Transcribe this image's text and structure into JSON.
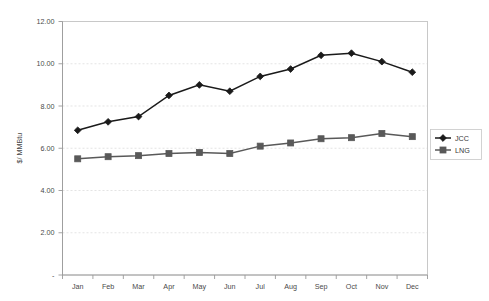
{
  "chart_data": {
    "type": "line",
    "title": "",
    "xlabel": "",
    "ylabel": "$/ MMBtu",
    "categories": [
      "Jan",
      "Feb",
      "Mar",
      "Apr",
      "May",
      "Jun",
      "Jul",
      "Aug",
      "Sep",
      "Oct",
      "Nov",
      "Dec"
    ],
    "ylim": [
      0,
      12
    ],
    "ytick_values": [
      0,
      2,
      4,
      6,
      8,
      10,
      12
    ],
    "ytick_labels": [
      "-",
      "2.00",
      "4.00",
      "6.00",
      "8.00",
      "10.00",
      "12.00"
    ],
    "grid": true,
    "legend_position": "right",
    "series": [
      {
        "name": "JCC",
        "color": "#1a1a1a",
        "marker": "diamond",
        "values": [
          6.85,
          7.25,
          7.5,
          8.5,
          9.0,
          8.7,
          9.4,
          9.75,
          10.4,
          10.5,
          10.1,
          9.6
        ]
      },
      {
        "name": "LNG",
        "color": "#595959",
        "marker": "square",
        "values": [
          5.5,
          5.6,
          5.65,
          5.75,
          5.8,
          5.75,
          6.1,
          6.25,
          6.45,
          6.5,
          6.7,
          6.55
        ]
      }
    ]
  },
  "axes": {
    "y_title": "$/ MMBtu"
  },
  "legend": {
    "entries": [
      {
        "label": "JCC"
      },
      {
        "label": "LNG"
      }
    ]
  }
}
